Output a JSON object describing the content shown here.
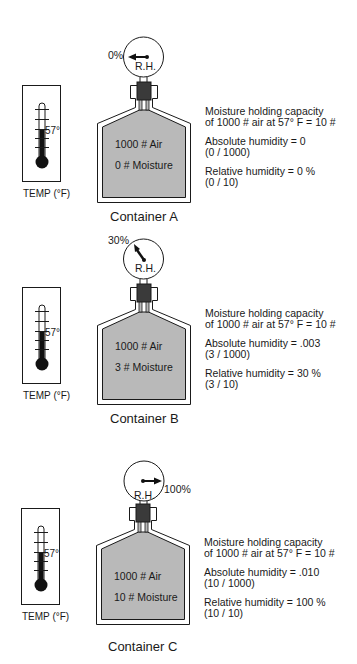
{
  "containers": [
    {
      "label": "Container A",
      "air": "1000 # Air",
      "moisture": "0 # Moisture",
      "gauge_reading": "0%",
      "gauge_label": "R.H.",
      "thermometer_reading": "57°",
      "thermometer_label": "TEMP (°F)",
      "capacity_line1": "Moisture holding capacity",
      "capacity_line2": "of 1000 # air at 57° F = 10 #",
      "absolute_humidity": "Absolute humidity = 0",
      "absolute_calc": "(0 / 1000)",
      "relative_humidity": "Relative humidity = 0 %",
      "relative_calc": "(0 / 10)"
    },
    {
      "label": "Container B",
      "air": "1000 # Air",
      "moisture": "3 # Moisture",
      "gauge_reading": "30%",
      "gauge_label": "R.H.",
      "thermometer_reading": "57°",
      "thermometer_label": "TEMP (°F)",
      "capacity_line1": "Moisture holding capacity",
      "capacity_line2": "of 1000 # air at 57° F = 10 #",
      "absolute_humidity": "Absolute humidity = .003",
      "absolute_calc": "(3 / 1000)",
      "relative_humidity": "Relative humidity = 30 %",
      "relative_calc": "(3 / 10)"
    },
    {
      "label": "Container C",
      "air": "1000 # Air",
      "moisture": "10 # Moisture",
      "gauge_reading": "100%",
      "gauge_label": "R.H.",
      "thermometer_reading": "57°",
      "thermometer_label": "TEMP (°F)",
      "capacity_line1": "Moisture holding capacity",
      "capacity_line2": "of 1000 # air at 57° F = 10 #",
      "absolute_humidity": "Absolute humidity = .010",
      "absolute_calc": "(10 / 1000)",
      "relative_humidity": "Relative humidity = 100 %",
      "relative_calc": "(10 / 10)"
    }
  ],
  "colors": {
    "air_fill": "#b9b9b9",
    "stopper": "#3a3a3a",
    "outline": "#1a1a1a"
  }
}
